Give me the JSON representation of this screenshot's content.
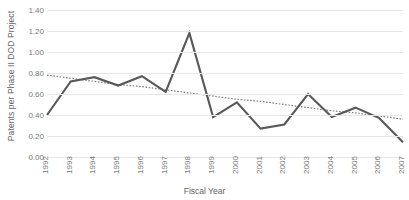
{
  "chart_data": {
    "type": "line",
    "title": "",
    "xlabel": "Fiscal Year",
    "ylabel": "Patents per Phase II DOD Project",
    "categories": [
      "1992",
      "1993",
      "1994",
      "1995",
      "1996",
      "1997",
      "1998",
      "1999",
      "2000",
      "2001",
      "2002",
      "2003",
      "2004",
      "2005",
      "2006",
      "2007"
    ],
    "series": [
      {
        "name": "Patents per Phase II DOD Project",
        "color": "#595959",
        "style": "solid",
        "values": [
          0.4,
          0.72,
          0.76,
          0.68,
          0.77,
          0.62,
          1.18,
          0.38,
          0.52,
          0.27,
          0.31,
          0.6,
          0.38,
          0.47,
          0.37,
          0.14
        ]
      },
      {
        "name": "Linear trendline",
        "color": "#808080",
        "style": "dotted",
        "values": [
          0.78,
          0.75,
          0.72,
          0.69,
          0.67,
          0.64,
          0.61,
          0.58,
          0.55,
          0.53,
          0.5,
          0.47,
          0.44,
          0.42,
          0.39,
          0.36
        ]
      }
    ],
    "ylim": [
      0.0,
      1.4
    ],
    "ytick_step": 0.2,
    "ytick_labels": [
      "1.40",
      "1.20",
      "1.00",
      "0.80",
      "0.60",
      "0.40",
      "0.20",
      "0.00"
    ],
    "ytick_values": [
      1.4,
      1.2,
      1.0,
      0.8,
      0.6,
      0.4,
      0.2,
      0.0
    ],
    "grid": "horizontal",
    "legend": "none",
    "gridline_color": "#e6e6e6",
    "background": "#ffffff",
    "xtick_rotation": -90
  }
}
